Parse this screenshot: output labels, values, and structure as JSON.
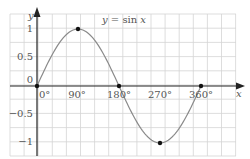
{
  "chart_data": {
    "type": "line",
    "title": "y = sin x",
    "xlabel": "x",
    "ylabel": "y",
    "x": [
      0,
      90,
      180,
      270,
      360
    ],
    "series": [
      {
        "name": "y = sin x",
        "values": [
          0,
          1,
          0,
          -1,
          0
        ],
        "color": "#8a8a8a"
      }
    ],
    "marked_points": [
      {
        "x": 0,
        "y": 0
      },
      {
        "x": 90,
        "y": 1
      },
      {
        "x": 180,
        "y": 0
      },
      {
        "x": 270,
        "y": -1
      },
      {
        "x": 360,
        "y": 0
      }
    ],
    "x_ticks": [
      "0°",
      "90°",
      "180°",
      "270°",
      "360°"
    ],
    "y_ticks": [
      "1",
      "0.5",
      "0",
      "-0.5",
      "-1"
    ],
    "xlim": [
      -60,
      405
    ],
    "ylim": [
      -1.25,
      1.25
    ],
    "grid": true,
    "legend": "none"
  },
  "labels": {
    "title": "y = sin x",
    "x_axis": "x",
    "y_axis": "y",
    "x_ticks": [
      "0°",
      "90°",
      "180°",
      "270°",
      "360°"
    ],
    "y_ticks": [
      "1",
      "0.5",
      "0",
      "−0.5",
      "−1"
    ]
  },
  "colors": {
    "grid": "#d4d4d4",
    "axis": "#222222",
    "curve": "#8a8a8a",
    "point": "#111111",
    "text": "#555555"
  }
}
